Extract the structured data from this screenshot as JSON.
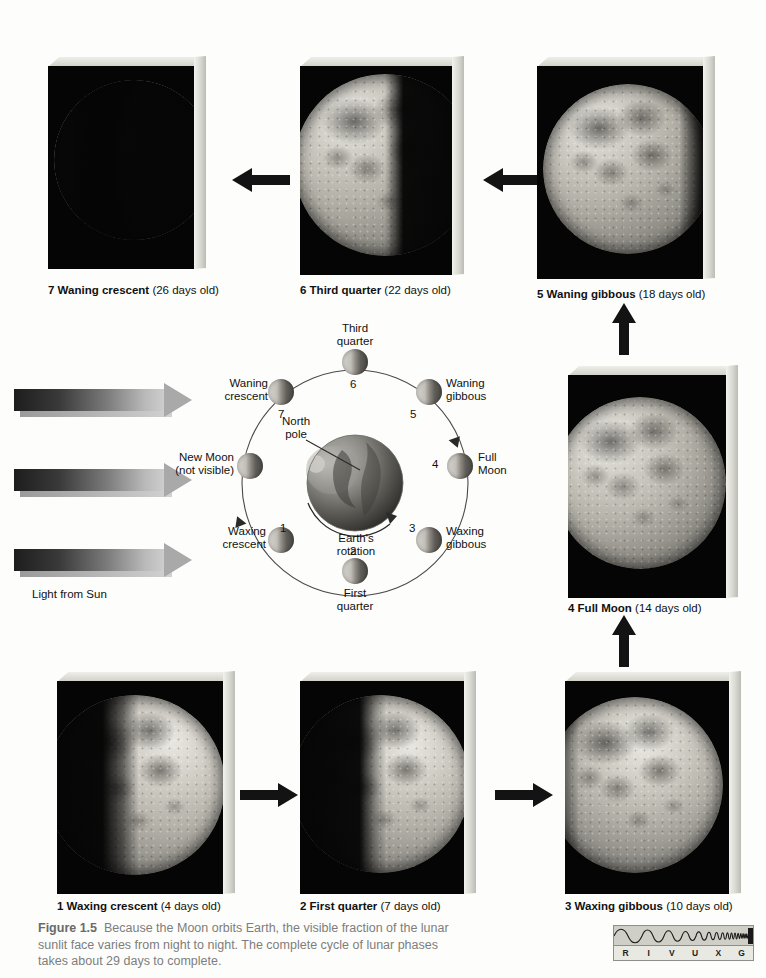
{
  "figure": {
    "number": "Figure 1.5",
    "caption": "Because the Moon orbits Earth, the visible fraction of the lunar sunlit face varies from night to night. The complete cycle of lunar phases takes about 29 days to complete."
  },
  "photo_panels": [
    {
      "id": "panel-7",
      "number": "7",
      "phase": "Waning crescent",
      "age": "(26 days old)",
      "caption_number": "7",
      "row": "top",
      "col": 0
    },
    {
      "id": "panel-6",
      "number": "6",
      "phase": "Third quarter",
      "age": "(22 days old)",
      "caption_number": "6",
      "row": "top",
      "col": 1
    },
    {
      "id": "panel-5",
      "number": "5",
      "phase": "Waning gibbous",
      "age": "(18 days old)",
      "caption_number": "5",
      "row": "top",
      "col": 2
    },
    {
      "id": "panel-4",
      "number": "4",
      "phase": "Full Moon",
      "age": "(14 days old)",
      "caption_number": "4",
      "row": "middle",
      "col": 2
    },
    {
      "id": "panel-1",
      "number": "1",
      "phase": "Waxing crescent",
      "age": "(4 days old)",
      "caption_number": "1",
      "row": "bottom",
      "col": 0
    },
    {
      "id": "panel-2",
      "number": "2",
      "phase": "First quarter",
      "age": "(7 days old)",
      "caption_number": "2",
      "row": "bottom",
      "col": 1
    },
    {
      "id": "panel-3",
      "number": "3",
      "phase": "Waxing gibbous",
      "age": "(10 days old)",
      "caption_number": "3",
      "row": "bottom",
      "col": 2
    }
  ],
  "captions": {
    "p7": {
      "bold": "7 Waning crescent",
      "age": " (26 days old)"
    },
    "p6": {
      "bold": "6 Third quarter",
      "age": " (22 days old)"
    },
    "p5": {
      "bold": "5 Waning gibbous",
      "age": " (18 days old)"
    },
    "p4": {
      "bold": "4 Full Moon",
      "age": " (14 days old)"
    },
    "p1": {
      "bold": "1 Waxing crescent",
      "age": " (4 days old)"
    },
    "p2": {
      "bold": "2 First quarter",
      "age": " (7 days old)"
    },
    "p3": {
      "bold": "3 Waxing gibbous",
      "age": " (10 days old)"
    }
  },
  "orbit_diagram": {
    "center_label_north_pole": "North\npole",
    "north_pole_line1": "North",
    "north_pole_line2": "pole",
    "rotation_label_line1": "Earth's",
    "rotation_label_line2": "rotation",
    "positions": [
      {
        "num": "1",
        "label_line1": "Waxing",
        "label_line2": "crescent"
      },
      {
        "num": "2",
        "label_line1": "First",
        "label_line2": "quarter"
      },
      {
        "num": "3",
        "label_line1": "Waxing",
        "label_line2": "gibbous"
      },
      {
        "num": "4",
        "label_line1": "Full",
        "label_line2": "Moon"
      },
      {
        "num": "5",
        "label_line1": "Waning",
        "label_line2": "gibbous"
      },
      {
        "num": "6",
        "label_line1": "Third",
        "label_line2": "quarter"
      },
      {
        "num": "7",
        "label_line1": "Waning",
        "label_line2": "crescent"
      },
      {
        "num": "",
        "label_line1": "New Moon",
        "label_line2": "(not visible)"
      }
    ]
  },
  "sunlight": {
    "label": "Light from Sun",
    "arrow_count": 3
  },
  "rivuxg": {
    "letters": [
      "R",
      "I",
      "V",
      "U",
      "X",
      "G"
    ]
  },
  "colors": {
    "page_background": "#fdfdfb",
    "photo_background": "#050505",
    "arrow_black": "#111111",
    "caption_gray": "#7d7d7d",
    "slab_edge": "#d8d8d2"
  }
}
